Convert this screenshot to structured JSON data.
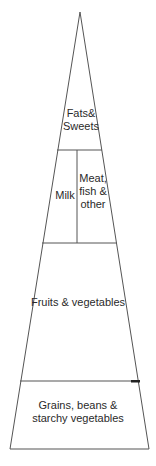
{
  "diagram": {
    "type": "food-pyramid",
    "colors": {
      "stroke": "#555555",
      "accent_mark": "#222222",
      "text": "#2a2a2a",
      "background": "#ffffff"
    },
    "tiers": [
      {
        "id": "fats-sweets",
        "lines": [
          "Fats&",
          "Sweets"
        ]
      },
      {
        "id": "milk",
        "lines": [
          "Milk"
        ]
      },
      {
        "id": "meat-fish-other",
        "lines": [
          "Meat,",
          "fish &",
          "other"
        ]
      },
      {
        "id": "fruits-vegetables",
        "lines": [
          "Fruits & vegetables"
        ]
      },
      {
        "id": "grains-beans-starchy",
        "lines": [
          "Grains, beans &",
          "starchy vegetables"
        ]
      }
    ]
  }
}
